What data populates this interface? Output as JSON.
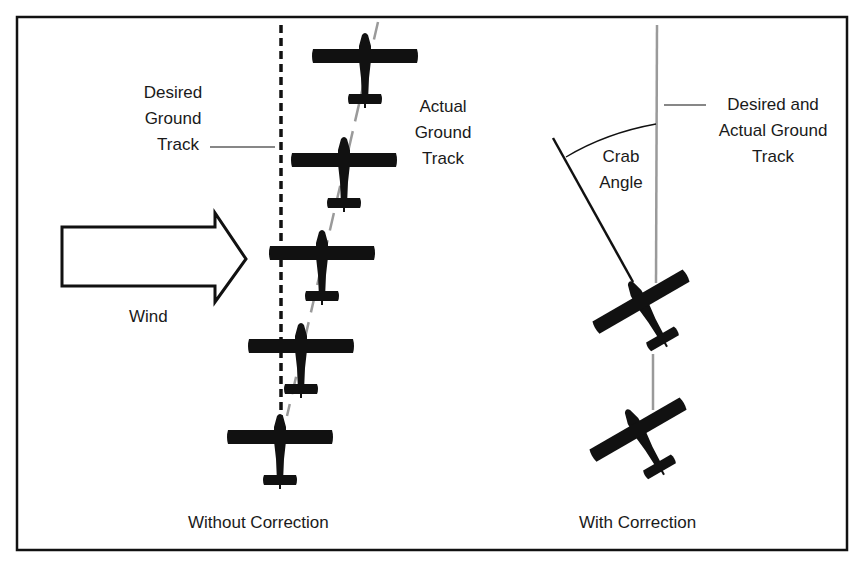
{
  "figure": {
    "colors": {
      "ink": "#111111",
      "track_gray": "#9a9a9a",
      "background": "#ffffff"
    },
    "left_panel": {
      "caption": "Without Correction",
      "wind_label": "Wind",
      "desired_track_label": [
        "Desired",
        "Ground",
        "Track"
      ],
      "actual_track_label": [
        "Actual",
        "Ground",
        "Track"
      ],
      "airplane_count": 5
    },
    "right_panel": {
      "caption": "With Correction",
      "crab_label": [
        "Crab",
        "Angle"
      ],
      "track_label": [
        "Desired and",
        "Actual Ground",
        "Track"
      ],
      "airplane_count": 2
    }
  }
}
